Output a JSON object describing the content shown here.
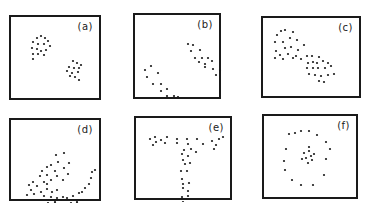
{
  "figure": {
    "panels": [
      {
        "id": "a",
        "label": "(a)",
        "box": {
          "x": 9,
          "y": 15,
          "w": 92,
          "h": 85
        },
        "description": "two compact blobs",
        "points": [
          [
            26,
            21
          ],
          [
            30,
            19
          ],
          [
            34,
            21
          ],
          [
            22,
            25
          ],
          [
            27,
            27
          ],
          [
            33,
            27
          ],
          [
            37,
            24
          ],
          [
            21,
            31
          ],
          [
            26,
            32
          ],
          [
            30,
            34
          ],
          [
            35,
            33
          ],
          [
            39,
            29
          ],
          [
            22,
            37
          ],
          [
            27,
            37
          ],
          [
            33,
            38
          ],
          [
            22,
            42
          ],
          [
            62,
            44
          ],
          [
            66,
            46
          ],
          [
            70,
            48
          ],
          [
            58,
            50
          ],
          [
            63,
            51
          ],
          [
            68,
            51
          ],
          [
            56,
            54
          ],
          [
            61,
            56
          ],
          [
            67,
            55
          ],
          [
            59,
            59
          ],
          [
            64,
            60
          ],
          [
            68,
            63
          ]
        ]
      },
      {
        "id": "b",
        "label": "(b)",
        "box": {
          "x": 133,
          "y": 13,
          "w": 88,
          "h": 86
        },
        "description": "two parallel elongated clusters",
        "points": [
          [
            53,
            29
          ],
          [
            58,
            30
          ],
          [
            56,
            36
          ],
          [
            65,
            35
          ],
          [
            60,
            43
          ],
          [
            67,
            43
          ],
          [
            73,
            43
          ],
          [
            64,
            47
          ],
          [
            70,
            49
          ],
          [
            77,
            46
          ],
          [
            70,
            52
          ],
          [
            78,
            54
          ],
          [
            85,
            55
          ],
          [
            81,
            60
          ],
          [
            10,
            55
          ],
          [
            16,
            51
          ],
          [
            12,
            62
          ],
          [
            23,
            58
          ],
          [
            18,
            69
          ],
          [
            26,
            69
          ],
          [
            32,
            74
          ],
          [
            26,
            76
          ],
          [
            39,
            81
          ],
          [
            32,
            81
          ],
          [
            43,
            82
          ],
          [
            40,
            88
          ],
          [
            48,
            87
          ]
        ]
      },
      {
        "id": "c",
        "label": "(c)",
        "box": {
          "x": 261,
          "y": 16,
          "w": 100,
          "h": 82
        },
        "description": "two touching clusters",
        "points": [
          [
            14,
            17
          ],
          [
            18,
            13
          ],
          [
            22,
            12
          ],
          [
            30,
            14
          ],
          [
            12,
            24
          ],
          [
            20,
            24
          ],
          [
            27,
            20
          ],
          [
            34,
            22
          ],
          [
            13,
            33
          ],
          [
            22,
            30
          ],
          [
            28,
            29
          ],
          [
            35,
            32
          ],
          [
            41,
            27
          ],
          [
            17,
            37
          ],
          [
            25,
            36
          ],
          [
            33,
            38
          ],
          [
            12,
            40
          ],
          [
            20,
            41
          ],
          [
            30,
            40
          ],
          [
            38,
            41
          ],
          [
            44,
            38
          ],
          [
            49,
            38
          ],
          [
            56,
            39
          ],
          [
            45,
            45
          ],
          [
            50,
            44
          ],
          [
            54,
            45
          ],
          [
            60,
            43
          ],
          [
            65,
            45
          ],
          [
            44,
            50
          ],
          [
            50,
            50
          ],
          [
            55,
            50
          ],
          [
            62,
            50
          ],
          [
            68,
            48
          ],
          [
            46,
            56
          ],
          [
            52,
            57
          ],
          [
            58,
            58
          ],
          [
            65,
            57
          ],
          [
            71,
            56
          ],
          [
            56,
            63
          ],
          [
            61,
            64
          ]
        ]
      },
      {
        "id": "d",
        "label": "(d)",
        "box": {
          "x": 9,
          "y": 118,
          "w": 92,
          "h": 83
        },
        "description": "spiral / crescent shaped clusters",
        "points": [
          [
            45,
            35
          ],
          [
            53,
            33
          ],
          [
            47,
            42
          ],
          [
            58,
            43
          ],
          [
            40,
            45
          ],
          [
            36,
            47
          ],
          [
            53,
            48
          ],
          [
            31,
            51
          ],
          [
            44,
            51
          ],
          [
            57,
            54
          ],
          [
            29,
            56
          ],
          [
            36,
            55
          ],
          [
            46,
            56
          ],
          [
            52,
            60
          ],
          [
            22,
            62
          ],
          [
            33,
            62
          ],
          [
            40,
            60
          ],
          [
            18,
            65
          ],
          [
            26,
            66
          ],
          [
            36,
            64
          ],
          [
            20,
            70
          ],
          [
            30,
            72
          ],
          [
            36,
            69
          ],
          [
            41,
            72
          ],
          [
            46,
            70
          ],
          [
            16,
            75
          ],
          [
            23,
            74
          ],
          [
            33,
            76
          ],
          [
            40,
            77
          ],
          [
            46,
            78
          ],
          [
            52,
            77
          ],
          [
            56,
            78
          ],
          [
            62,
            76
          ],
          [
            68,
            73
          ],
          [
            71,
            72
          ],
          [
            74,
            68
          ],
          [
            78,
            64
          ],
          [
            80,
            58
          ],
          [
            81,
            52
          ],
          [
            84,
            50
          ],
          [
            37,
            83
          ],
          [
            44,
            82
          ],
          [
            49,
            80
          ],
          [
            54,
            84
          ],
          [
            60,
            83
          ],
          [
            66,
            82
          ],
          [
            70,
            80
          ],
          [
            48,
            89
          ],
          [
            56,
            89
          ],
          [
            62,
            88
          ]
        ]
      },
      {
        "id": "e",
        "label": "(e)",
        "box": {
          "x": 134,
          "y": 116,
          "w": 98,
          "h": 84
        },
        "description": "T-shaped (Y) cluster",
        "points": [
          [
            14,
            21
          ],
          [
            19,
            19
          ],
          [
            20,
            24
          ],
          [
            25,
            22
          ],
          [
            17,
            27
          ],
          [
            31,
            19
          ],
          [
            29,
            25
          ],
          [
            41,
            21
          ],
          [
            41,
            25
          ],
          [
            51,
            21
          ],
          [
            52,
            26
          ],
          [
            61,
            21
          ],
          [
            67,
            26
          ],
          [
            76,
            23
          ],
          [
            80,
            27
          ],
          [
            83,
            21
          ],
          [
            87,
            19
          ],
          [
            78,
            31
          ],
          [
            55,
            31
          ],
          [
            48,
            32
          ],
          [
            60,
            34
          ],
          [
            46,
            36
          ],
          [
            52,
            38
          ],
          [
            47,
            42
          ],
          [
            49,
            46
          ],
          [
            54,
            45
          ],
          [
            45,
            53
          ],
          [
            51,
            53
          ],
          [
            46,
            61
          ],
          [
            47,
            66
          ],
          [
            53,
            65
          ],
          [
            47,
            70
          ],
          [
            52,
            73
          ],
          [
            46,
            79
          ],
          [
            52,
            78
          ],
          [
            47,
            84
          ]
        ]
      },
      {
        "id": "f",
        "label": "(f)",
        "box": {
          "x": 262,
          "y": 114,
          "w": 96,
          "h": 85
        },
        "description": "ring surrounding a small central cluster",
        "points": [
          [
            25,
            18
          ],
          [
            31,
            17
          ],
          [
            37,
            15
          ],
          [
            45,
            15
          ],
          [
            53,
            19
          ],
          [
            62,
            26
          ],
          [
            66,
            33
          ],
          [
            22,
            33
          ],
          [
            20,
            45
          ],
          [
            62,
            43
          ],
          [
            21,
            54
          ],
          [
            28,
            64
          ],
          [
            60,
            59
          ],
          [
            37,
            69
          ],
          [
            49,
            69
          ],
          [
            40,
            37
          ],
          [
            45,
            35
          ],
          [
            47,
            40
          ],
          [
            42,
            42
          ],
          [
            38,
            43
          ],
          [
            50,
            38
          ],
          [
            44,
            47
          ],
          [
            48,
            44
          ],
          [
            45,
            31
          ]
        ]
      }
    ]
  }
}
